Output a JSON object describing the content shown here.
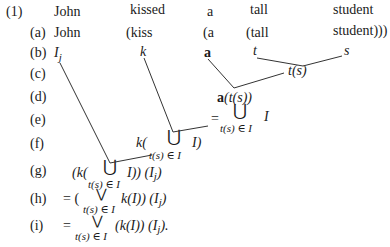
{
  "example_number": "(1)",
  "row_labels": [
    "(a)",
    "(b)",
    "(c)",
    "(d)",
    "(e)",
    "(f)",
    "(g)",
    "(h)",
    "(i)"
  ],
  "sentence": [
    "John",
    "kissed",
    "a",
    "tall",
    "student"
  ],
  "row_a": [
    "John",
    "(kiss",
    "(a",
    "(tall",
    "student)))"
  ],
  "row_b": {
    "subject": "I",
    "subject_sub": "j",
    "verb": "k",
    "det": "a",
    "adj": "t",
    "noun": "s"
  },
  "nodes": {
    "ts": "t(s)",
    "a_ts": "a(t(s))",
    "e_eq": "=",
    "union": "⋃",
    "sub_index": "t(s) ∈ I",
    "I": "I",
    "f_k": "k(",
    "f_close": "I)",
    "g_open": "(k(",
    "g_close": "I)) (I",
    "g_sub_j": "j",
    "g_end": ")",
    "h_open": "= (",
    "vee": "⋁",
    "h_mid": "k(I)) (I",
    "h_sub_j": "j",
    "h_end": ")",
    "i_open": "=",
    "i_mid": "(k(I)) (I",
    "i_sub_j": "j",
    "i_end": ")."
  }
}
